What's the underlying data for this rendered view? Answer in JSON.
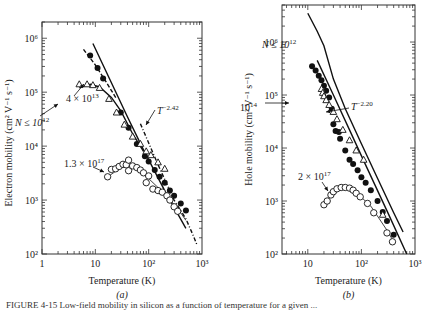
{
  "figure": {
    "caption_partial": "FIGURE 4-15  Low-field mobility in silicon as a function of temperature for a given ..."
  },
  "chart_data": [
    {
      "type": "scatter",
      "panel_label": "(a)",
      "xlabel": "Temperature (K)",
      "ylabel": "Electron mobility (cm² V⁻¹ s⁻¹)",
      "xscale": "log",
      "yscale": "log",
      "xlim": [
        1,
        1000
      ],
      "ylim": [
        100,
        2000000
      ],
      "xticks": [
        {
          "v": 1,
          "label": "1"
        },
        {
          "v": 10,
          "label": "10"
        },
        {
          "v": 100,
          "label": "10²"
        },
        {
          "v": 1000,
          "label": "10³"
        }
      ],
      "yticks": [
        {
          "v": 100,
          "label": "10²"
        },
        {
          "v": 1000,
          "label": "10³"
        },
        {
          "v": 10000,
          "label": "10⁴"
        },
        {
          "v": 100000,
          "label": "10⁵"
        },
        {
          "v": 1000000,
          "label": "10⁶"
        }
      ],
      "frame": {
        "x0": 42,
        "x1": 202,
        "y0": 22,
        "y1": 254
      },
      "series": [
        {
          "name": "N ≤ 10^12",
          "marker": "filled-circle",
          "points": [
            [
              8,
              480000
            ],
            [
              11,
              280000
            ],
            [
              14,
              180000
            ],
            [
              30,
              42000
            ],
            [
              42,
              22000
            ],
            [
              60,
              11000
            ],
            [
              85,
              6500
            ],
            [
              100,
              5200
            ],
            [
              130,
              3600
            ],
            [
              160,
              2700
            ],
            [
              200,
              2100
            ],
            [
              250,
              1500
            ],
            [
              300,
              1200
            ],
            [
              400,
              860
            ],
            [
              500,
              640
            ]
          ]
        },
        {
          "name": "4 × 10^13",
          "marker": "open-triangle",
          "points": [
            [
              5,
              140000
            ],
            [
              7,
              140000
            ],
            [
              9,
              135000
            ],
            [
              12,
              120000
            ],
            [
              18,
              75000
            ],
            [
              25,
              42000
            ],
            [
              35,
              25000
            ],
            [
              50,
              15000
            ],
            [
              70,
              11000
            ],
            [
              90,
              8000
            ],
            [
              110,
              6800
            ],
            [
              150,
              5000
            ],
            [
              200,
              3800
            ]
          ]
        },
        {
          "name": "1.3 × 10^17",
          "marker": "open-circle",
          "points": [
            [
              17,
              2700
            ],
            [
              20,
              3700
            ],
            [
              24,
              3800
            ],
            [
              28,
              4200
            ],
            [
              33,
              4600
            ],
            [
              38,
              4500
            ],
            [
              42,
              3500
            ],
            [
              42,
              5500
            ],
            [
              50,
              4300
            ],
            [
              60,
              4000
            ],
            [
              70,
              3600
            ],
            [
              80,
              3200
            ],
            [
              90,
              2100
            ],
            [
              100,
              2800
            ],
            [
              120,
              1600
            ],
            [
              150,
              1500
            ],
            [
              180,
              1400
            ],
            [
              220,
              1200
            ],
            [
              250,
              1000
            ],
            [
              300,
              750
            ],
            [
              350,
              620
            ]
          ]
        }
      ],
      "curves": [
        {
          "name": "N ≤ 10^12 dashed fit",
          "style": "dashed",
          "points": [
            [
              6,
              620000
            ],
            [
              10,
              320000
            ],
            [
              15,
              170000
            ],
            [
              25,
              75000
            ]
          ]
        },
        {
          "name": "theory solid",
          "style": "solid",
          "points": [
            [
              9,
              800000
            ],
            [
              20,
              150000
            ],
            [
              40,
              35000
            ],
            [
              80,
              8500
            ],
            [
              200,
              1500
            ],
            [
              500,
              300
            ]
          ]
        },
        {
          "name": "4 × 10^13 fit",
          "style": "solid",
          "points": [
            [
              5,
              120000
            ],
            [
              8,
              140000
            ],
            [
              12,
              125000
            ],
            [
              20,
              80000
            ],
            [
              30,
              45000
            ],
            [
              50,
              17000
            ],
            [
              80,
              8000
            ]
          ]
        },
        {
          "name": "1.3 × 10^17 fit",
          "style": "solid-thin",
          "points": [
            [
              17,
              2700
            ],
            [
              25,
              3500
            ],
            [
              40,
              4500
            ],
            [
              60,
              3800
            ],
            [
              100,
              2500
            ],
            [
              200,
              1300
            ],
            [
              350,
              700
            ],
            [
              500,
              420
            ]
          ]
        },
        {
          "name": "T^-2.42",
          "style": "dash-dot",
          "points": [
            [
              70,
              26000
            ],
            [
              150,
              4500
            ],
            [
              300,
              1000
            ],
            [
              500,
              450
            ],
            [
              700,
              210
            ],
            [
              800,
              150
            ]
          ]
        }
      ],
      "annotations": [
        {
          "text": "N ≤ 10",
          "sup": "12",
          "x": 15,
          "y": 126
        },
        {
          "text": "4 × 10",
          "sup": "13",
          "x": 66,
          "y": 102
        },
        {
          "text": "T",
          "sup": "−2.42",
          "x": 157,
          "y": 114
        },
        {
          "text": "1.3 × 10",
          "sup": "17",
          "x": 64,
          "y": 167
        }
      ]
    },
    {
      "type": "scatter",
      "panel_label": "(b)",
      "xlabel": "Temperature (K)",
      "ylabel": "Hole mobility (cm² V⁻¹ s⁻¹)",
      "xscale": "log",
      "yscale": "log",
      "xlim": [
        3.3,
        1000
      ],
      "ylim": [
        100,
        5000000
      ],
      "xticks": [
        {
          "v": 10,
          "label": "10"
        },
        {
          "v": 100,
          "label": "10²"
        },
        {
          "v": 1000,
          "label": "10³"
        }
      ],
      "yticks": [
        {
          "v": 100,
          "label": "10²"
        },
        {
          "v": 1000,
          "label": "10³"
        },
        {
          "v": 10000,
          "label": "10⁴"
        },
        {
          "v": 100000,
          "label": "10⁵"
        },
        {
          "v": 1000000,
          "label": "10⁶"
        }
      ],
      "frame": {
        "x0": 282,
        "x1": 415,
        "y0": 5,
        "y1": 254
      },
      "series": [
        {
          "name": "N ≤ 10^12",
          "marker": "filled-circle",
          "points": [
            [
              12,
              350000
            ],
            [
              14,
              290000
            ],
            [
              16,
              230000
            ],
            [
              18,
              190000
            ],
            [
              20,
              150000
            ],
            [
              22,
              120000
            ],
            [
              25,
              90000
            ],
            [
              28,
              55000
            ],
            [
              30,
              28000
            ],
            [
              33,
              21000
            ],
            [
              38,
              20000
            ],
            [
              40,
              15000
            ],
            [
              50,
              9000
            ],
            [
              60,
              6000
            ],
            [
              70,
              5000
            ],
            [
              85,
              3800
            ],
            [
              100,
              2800
            ],
            [
              120,
              2200
            ],
            [
              150,
              1600
            ],
            [
              200,
              1000
            ],
            [
              250,
              620
            ],
            [
              300,
              420
            ],
            [
              400,
              230
            ]
          ]
        },
        {
          "name": "10^14",
          "marker": "open-triangle",
          "points": [
            [
              18,
              130000
            ],
            [
              19,
              110000
            ],
            [
              20,
              95000
            ],
            [
              22,
              80000
            ],
            [
              25,
              65000
            ],
            [
              30,
              48000
            ],
            [
              35,
              35000
            ],
            [
              45,
              22000
            ],
            [
              60,
              14000
            ],
            [
              80,
              9000
            ],
            [
              110,
              6000
            ],
            [
              250,
              550
            ]
          ]
        },
        {
          "name": "2 × 10^17",
          "marker": "open-circle",
          "points": [
            [
              20,
              850
            ],
            [
              23,
              1000
            ],
            [
              27,
              1300
            ],
            [
              30,
              1500
            ],
            [
              35,
              1700
            ],
            [
              42,
              1800
            ],
            [
              50,
              1800
            ],
            [
              60,
              1750
            ],
            [
              70,
              1600
            ],
            [
              80,
              1400
            ],
            [
              95,
              1200
            ],
            [
              130,
              900
            ],
            [
              170,
              600
            ],
            [
              300,
              250
            ],
            [
              380,
              170
            ]
          ]
        }
      ],
      "curves": [
        {
          "name": "N ≤ 10^12 theory",
          "style": "solid",
          "points": [
            [
              10,
              3500000
            ],
            [
              15,
              1600000
            ],
            [
              20,
              850000
            ],
            [
              30,
              200000
            ],
            [
              50,
              55000
            ],
            [
              100,
              12000
            ],
            [
              200,
              2700
            ],
            [
              400,
              600
            ],
            [
              600,
              260
            ]
          ]
        },
        {
          "name": "T^-2.20 fit",
          "style": "solid",
          "points": [
            [
              15,
              450000
            ],
            [
              30,
              100000
            ],
            [
              60,
              22000
            ],
            [
              120,
              4800
            ],
            [
              300,
              650
            ],
            [
              700,
              100
            ]
          ]
        },
        {
          "name": "2 × 10^17 fit",
          "style": "solid-thin",
          "points": [
            [
              20,
              850
            ],
            [
              27,
              1300
            ],
            [
              40,
              1800
            ],
            [
              55,
              1800
            ],
            [
              80,
              1450
            ],
            [
              150,
              800
            ],
            [
              300,
              280
            ],
            [
              400,
              170
            ]
          ]
        }
      ],
      "annotations": [
        {
          "text": "N ≤ 10",
          "sup": "12",
          "x": 262,
          "y": 48
        },
        {
          "text": "10",
          "sup": "14",
          "x": 240,
          "y": 111
        },
        {
          "text": "T",
          "sup": "−2.20",
          "x": 351,
          "y": 110
        },
        {
          "text": "2 × 10",
          "sup": "17",
          "x": 298,
          "y": 180
        }
      ]
    }
  ]
}
